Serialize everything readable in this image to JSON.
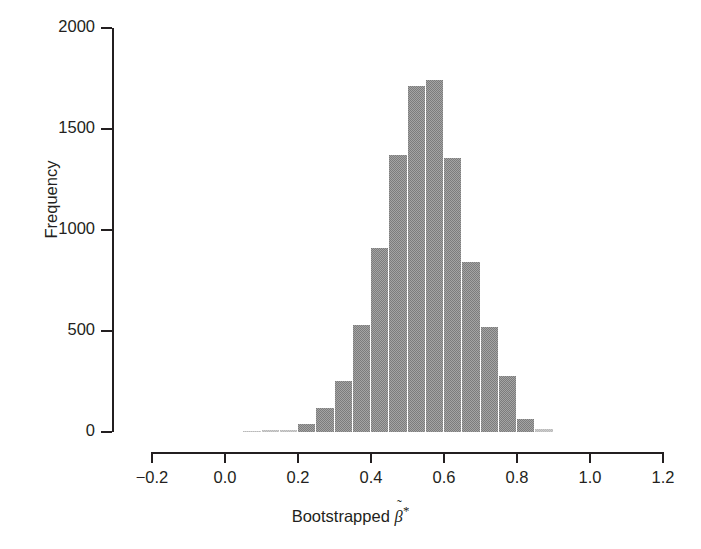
{
  "chart_data": {
    "type": "bar",
    "chart_subtype": "histogram",
    "title": "",
    "xlabel": "Bootstrapped β̃*",
    "xlabel_parts": {
      "prefix": "Bootstrapped ",
      "symbol": "β",
      "accent": "˜",
      "superscript": "*"
    },
    "ylabel": "Frequency",
    "xlim": [
      -0.2,
      1.2
    ],
    "ylim": [
      0,
      2000
    ],
    "xticks": [
      -0.2,
      0.0,
      0.2,
      0.4,
      0.6,
      0.8,
      1.0,
      1.2
    ],
    "xtick_labels": [
      "−0.2",
      "0.0",
      "0.2",
      "0.4",
      "0.6",
      "0.8",
      "1.0",
      "1.2"
    ],
    "yticks": [
      0,
      500,
      1000,
      1500,
      2000
    ],
    "ytick_labels": [
      "0",
      "500",
      "1000",
      "1500",
      "2000"
    ],
    "grid": false,
    "legend": null,
    "bar_color": "#7c7c7c",
    "axis_color": "#231f20",
    "background_color": "#ffffff",
    "bin_width": 0.05,
    "bin_left_edges": [
      0.05,
      0.1,
      0.15,
      0.2,
      0.25,
      0.3,
      0.35,
      0.4,
      0.45,
      0.5,
      0.55,
      0.6,
      0.65,
      0.7,
      0.75,
      0.8,
      0.85
    ],
    "bin_centers": [
      0.075,
      0.125,
      0.175,
      0.225,
      0.275,
      0.325,
      0.375,
      0.425,
      0.475,
      0.525,
      0.575,
      0.625,
      0.675,
      0.725,
      0.775,
      0.825,
      0.875
    ],
    "categories": [
      "0.05",
      "0.10",
      "0.15",
      "0.20",
      "0.25",
      "0.30",
      "0.35",
      "0.40",
      "0.45",
      "0.50",
      "0.55",
      "0.60",
      "0.65",
      "0.70",
      "0.75",
      "0.80",
      "0.85"
    ],
    "values": [
      5,
      8,
      12,
      40,
      120,
      255,
      530,
      910,
      1370,
      1715,
      1745,
      1355,
      840,
      520,
      275,
      65,
      15
    ]
  },
  "figure": {
    "width": 701,
    "height": 549
  }
}
